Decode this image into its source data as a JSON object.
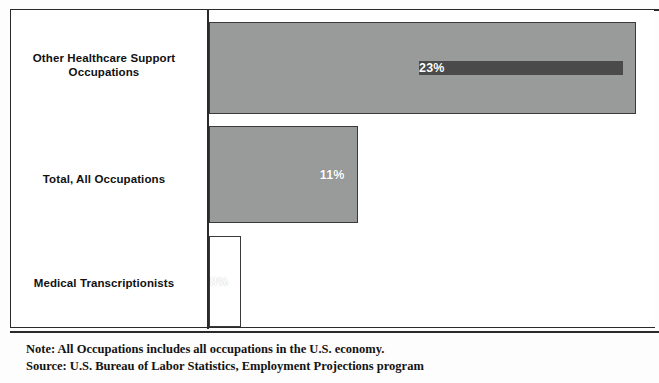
{
  "chart_data": {
    "type": "bar",
    "orientation": "horizontal",
    "title": "",
    "xlabel": "",
    "ylabel": "",
    "categories": [
      "Other Healthcare Support Occupations",
      "Total, All Occupations",
      "Medical Transcriptionists"
    ],
    "values": [
      23,
      11,
      8
    ],
    "value_labels": [
      "23%",
      "11%",
      "8%"
    ],
    "xlim": [
      0,
      24
    ],
    "grid": false,
    "legend": false,
    "bar_colors": [
      "#999a9a",
      "#4a4a4a",
      "#999a9a"
    ],
    "value_label_color": "#ffffff"
  },
  "chart": {
    "categories": [
      {
        "label_line1": "Other Healthcare Support",
        "label_line2": "Occupations",
        "value_label": "23%"
      },
      {
        "label_line1": "Total, All Occupations",
        "label_line2": "",
        "value_label": "11%"
      },
      {
        "label_line1": "Medical Transcriptionists",
        "label_line2": "",
        "value_label": "8%"
      }
    ]
  },
  "notes": {
    "note": "Note: All Occupations includes all occupations in the U.S. economy.",
    "source": "Source: U.S. Bureau of Labor Statistics, Employment Projections program"
  },
  "colors": {
    "bar_light": "#999a9a",
    "bar_dark": "#4a4a4a",
    "frame": "#2a2a2a",
    "text": "#111111"
  }
}
